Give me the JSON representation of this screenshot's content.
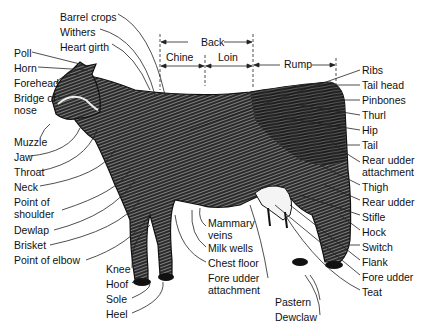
{
  "diagram": {
    "regions_top": [
      {
        "label": "Back",
        "x": 216,
        "y": 43
      },
      {
        "label": "Chine",
        "x": 166,
        "y": 57
      },
      {
        "label": "Loin",
        "x": 218,
        "y": 57
      },
      {
        "label": "Rump",
        "x": 284,
        "y": 63
      }
    ],
    "labels_left": [
      {
        "id": "barrel-crops",
        "label": "Barrel crops",
        "x": 60,
        "y": 12
      },
      {
        "id": "withers",
        "label": "Withers",
        "x": 60,
        "y": 27
      },
      {
        "id": "heart-girth",
        "label": "Heart girth",
        "x": 60,
        "y": 42
      },
      {
        "id": "poll",
        "label": "Poll",
        "x": 14,
        "y": 49
      },
      {
        "id": "horn",
        "label": "Horn",
        "x": 14,
        "y": 64
      },
      {
        "id": "forehead",
        "label": "Forehead",
        "x": 14,
        "y": 79
      },
      {
        "id": "bridge-of-nose",
        "label": "Bridge of nose",
        "x": 14,
        "y": 94
      },
      {
        "id": "muzzle",
        "label": "Muzzle",
        "x": 14,
        "y": 138
      },
      {
        "id": "jaw",
        "label": "Jaw",
        "x": 14,
        "y": 153
      },
      {
        "id": "throat",
        "label": "Throat",
        "x": 14,
        "y": 168
      },
      {
        "id": "neck",
        "label": "Neck",
        "x": 14,
        "y": 183
      },
      {
        "id": "point-of-shoulder",
        "label": "Point of shoulder",
        "x": 14,
        "y": 198
      },
      {
        "id": "dewlap",
        "label": "Dewlap",
        "x": 14,
        "y": 227
      },
      {
        "id": "brisket",
        "label": "Brisket",
        "x": 14,
        "y": 242
      },
      {
        "id": "point-of-elbow",
        "label": "Point of elbow",
        "x": 14,
        "y": 257
      }
    ],
    "labels_bottom": [
      {
        "id": "knee",
        "label": "Knee",
        "x": 106,
        "y": 265
      },
      {
        "id": "hoof",
        "label": "Hoof",
        "x": 106,
        "y": 280
      },
      {
        "id": "sole",
        "label": "Sole",
        "x": 106,
        "y": 295
      },
      {
        "id": "heel",
        "label": "Heel",
        "x": 106,
        "y": 310
      },
      {
        "id": "mammary-veins",
        "label": "Mammary veins",
        "x": 208,
        "y": 220
      },
      {
        "id": "milk-wells",
        "label": "Milk wells",
        "x": 208,
        "y": 243
      },
      {
        "id": "chest-floor",
        "label": "Chest floor",
        "x": 208,
        "y": 258
      },
      {
        "id": "fore-udder-attachment",
        "label": "Fore udder attachment",
        "x": 208,
        "y": 273
      },
      {
        "id": "pastern",
        "label": "Pastern",
        "x": 275,
        "y": 296
      },
      {
        "id": "dewclaw",
        "label": "Dewclaw",
        "x": 275,
        "y": 311
      }
    ],
    "labels_right": [
      {
        "id": "ribs",
        "label": "Ribs",
        "x": 362,
        "y": 66
      },
      {
        "id": "tail-head",
        "label": "Tail head",
        "x": 362,
        "y": 81
      },
      {
        "id": "pinbones",
        "label": "Pinbones",
        "x": 362,
        "y": 96
      },
      {
        "id": "thurl",
        "label": "Thurl",
        "x": 362,
        "y": 111
      },
      {
        "id": "hip",
        "label": "Hip",
        "x": 362,
        "y": 126
      },
      {
        "id": "tail",
        "label": "Tail",
        "x": 362,
        "y": 141
      },
      {
        "id": "rear-udder-attachment",
        "label": "Rear udder attachment",
        "x": 362,
        "y": 156
      },
      {
        "id": "thigh",
        "label": "Thigh",
        "x": 362,
        "y": 181
      },
      {
        "id": "rear-udder",
        "label": "Rear udder",
        "x": 362,
        "y": 196
      },
      {
        "id": "stifle",
        "label": "Stifle",
        "x": 362,
        "y": 211
      },
      {
        "id": "hock",
        "label": "Hock",
        "x": 362,
        "y": 226
      },
      {
        "id": "switch",
        "label": "Switch",
        "x": 362,
        "y": 241
      },
      {
        "id": "flank",
        "label": "Flank",
        "x": 362,
        "y": 256
      },
      {
        "id": "fore-udder",
        "label": "Fore udder",
        "x": 362,
        "y": 271
      },
      {
        "id": "teat",
        "label": "Teat",
        "x": 362,
        "y": 286
      }
    ]
  }
}
